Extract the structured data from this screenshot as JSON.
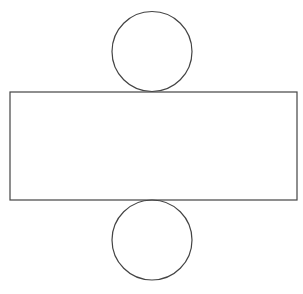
{
  "diagram": {
    "stroke_color": "#444444",
    "background": "#ffffff",
    "shapes": {
      "top_circle": {
        "cx": 152,
        "cy": 51.5,
        "r": 40
      },
      "rectangle": {
        "x": 10,
        "y": 92,
        "width": 287,
        "height": 108
      },
      "bottom_circle": {
        "cx": 152,
        "cy": 240,
        "r": 40
      }
    }
  }
}
